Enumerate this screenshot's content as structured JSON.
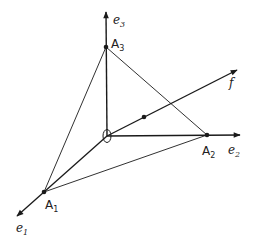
{
  "diagram": {
    "points": {
      "O": {
        "label": "O",
        "x": 107,
        "y": 136
      },
      "A1": {
        "label": "A",
        "sub": "1",
        "x": 44,
        "y": 192
      },
      "A2": {
        "label": "A",
        "sub": "2",
        "x": 207,
        "y": 135
      },
      "A3": {
        "label": "A",
        "sub": "3",
        "x": 106,
        "y": 47
      },
      "F": {
        "x": 144,
        "y": 117
      }
    },
    "axes": {
      "e1": {
        "label": "e",
        "sub": "1"
      },
      "e2": {
        "label": "e",
        "sub": "2"
      },
      "e3": {
        "label": "e",
        "sub": "3"
      },
      "f": {
        "label": "f"
      }
    },
    "colors": {
      "stroke": "#1a1a1a",
      "background": "#ffffff"
    }
  }
}
